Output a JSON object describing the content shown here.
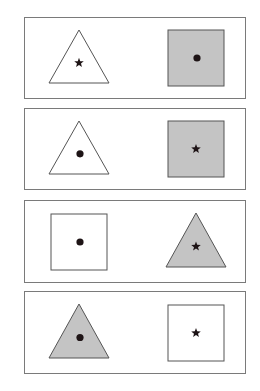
{
  "colors": {
    "panel_border": "#7a7a7a",
    "shape_stroke": "#555555",
    "shaded_fill": "#c4c4c4",
    "unshaded_fill": "#ffffff",
    "marker": "#1e1416"
  },
  "panels": [
    {
      "index": 1,
      "top": 17,
      "height": 82,
      "left_shape": {
        "type": "triangle",
        "fill": "unshaded",
        "marker": "star"
      },
      "right_shape": {
        "type": "square",
        "fill": "shaded",
        "marker": "dot"
      }
    },
    {
      "index": 2,
      "top": 108,
      "height": 82,
      "left_shape": {
        "type": "triangle",
        "fill": "unshaded",
        "marker": "dot"
      },
      "right_shape": {
        "type": "square",
        "fill": "shaded",
        "marker": "star"
      }
    },
    {
      "index": 3,
      "top": 200,
      "height": 83,
      "left_shape": {
        "type": "square",
        "fill": "unshaded",
        "marker": "dot"
      },
      "right_shape": {
        "type": "triangle",
        "fill": "shaded",
        "marker": "star"
      }
    },
    {
      "index": 4,
      "top": 291,
      "height": 83,
      "left_shape": {
        "type": "triangle",
        "fill": "shaded",
        "marker": "dot"
      },
      "right_shape": {
        "type": "square",
        "fill": "unshaded",
        "marker": "star"
      }
    }
  ]
}
